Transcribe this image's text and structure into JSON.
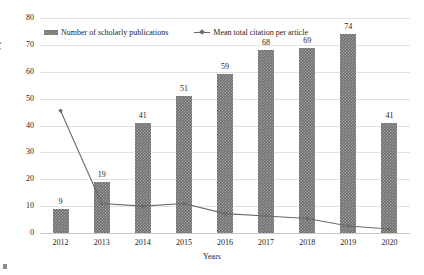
{
  "chart_data": {
    "type": "bar",
    "title": "",
    "xlabel": "Years",
    "ylabel": "No. of scholarly publications",
    "categories": [
      "2012",
      "2013",
      "2014",
      "2015",
      "2016",
      "2017",
      "2018",
      "2019",
      "2020"
    ],
    "ylim": [
      0,
      80
    ],
    "yticks": [
      0,
      10,
      20,
      30,
      40,
      50,
      60,
      70,
      80
    ],
    "ytick_labels": [
      "0",
      "10",
      "20",
      "30",
      "40",
      "50",
      "60",
      "70",
      "80"
    ],
    "grid": true,
    "legend_position": "top-left-inside",
    "series": [
      {
        "name": "Number of scholarly publications",
        "type": "bar",
        "color": "#6f6f6f",
        "values": [
          9,
          19,
          41,
          51,
          59,
          68,
          69,
          74,
          41
        ],
        "data_labels": [
          "9",
          "19",
          "41",
          "51",
          "59",
          "68",
          "69",
          "74",
          "41"
        ]
      },
      {
        "name": "Mean total citation per article",
        "type": "line",
        "color": "#6a6a6a",
        "values": [
          45.5,
          11,
          10,
          11,
          7.2,
          6.3,
          5.4,
          2.6,
          1.5
        ],
        "data_labels": []
      }
    ]
  },
  "legend": {
    "items": [
      {
        "label": "Number of scholarly publications",
        "marker": "bar-swatch-icon"
      },
      {
        "label": "Mean total citation per article",
        "marker": "line-marker-icon"
      }
    ]
  },
  "axes": {
    "y_title": "No. of scholarly publications",
    "x_title": "Years"
  }
}
